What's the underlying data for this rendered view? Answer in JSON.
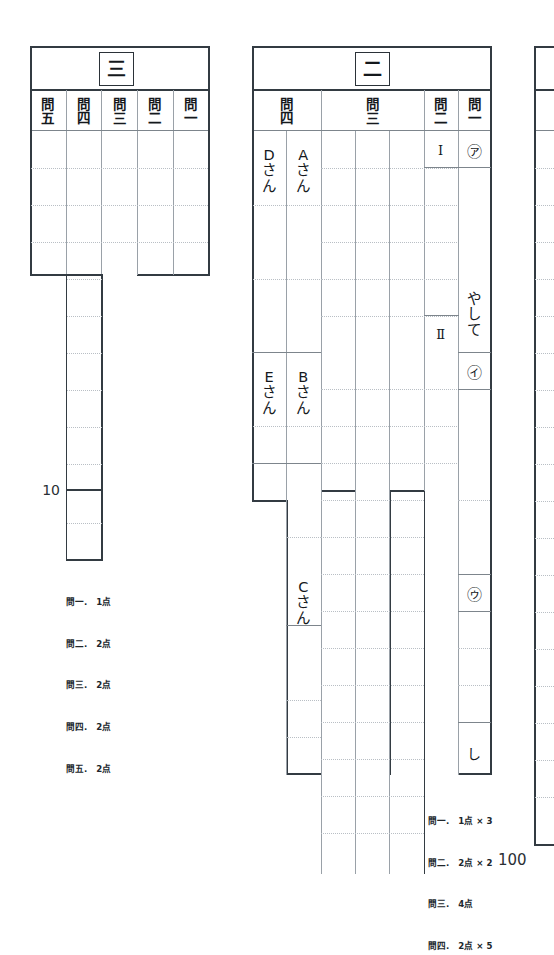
{
  "document": {
    "kind": "japanese-answer-sheet",
    "total_score": "100"
  },
  "sections": [
    {
      "id": "section-three",
      "title": "三",
      "columns": [
        {
          "id": "toi-5",
          "label_top": "問",
          "label_bottom": "五"
        },
        {
          "id": "toi-4",
          "label_top": "問",
          "label_bottom": "四"
        },
        {
          "id": "toi-3",
          "label_top": "問",
          "label_bottom": "三"
        },
        {
          "id": "toi-2",
          "label_top": "問",
          "label_bottom": "二"
        },
        {
          "id": "toi-1",
          "label_top": "問",
          "label_bottom": "一"
        }
      ],
      "side_number": "10",
      "legend": [
        "問一.　1点",
        "問二.　2点",
        "問三.　2点",
        "問四.　2点",
        "問五.　2点"
      ]
    },
    {
      "id": "section-two",
      "title": "二",
      "columns": [
        {
          "id": "toi-4",
          "label_top": "問",
          "label_bottom": "四",
          "span": 2
        },
        {
          "id": "toi-3",
          "label_top": "問",
          "label_bottom": "三",
          "span": 3
        },
        {
          "id": "toi-2",
          "label_top": "問",
          "label_bottom": "二",
          "span": 1
        },
        {
          "id": "toi-1",
          "label_top": "問",
          "label_bottom": "一",
          "span": 1
        }
      ],
      "answers": {
        "toi4_col_left": [
          {
            "id": "d-san",
            "chars": [
              "D",
              "さ",
              "ん"
            ]
          },
          {
            "id": "e-san",
            "chars": [
              "E",
              "さ",
              "ん"
            ]
          }
        ],
        "toi4_col_right": [
          {
            "id": "a-san",
            "chars": [
              "A",
              "さ",
              "ん"
            ]
          },
          {
            "id": "b-san",
            "chars": [
              "B",
              "さ",
              "ん"
            ]
          },
          {
            "id": "c-san",
            "chars": [
              "C",
              "さ",
              "ん"
            ]
          }
        ],
        "toi2": [
          {
            "id": "roman-1",
            "text": "Ⅰ"
          },
          {
            "id": "roman-2",
            "text": "Ⅱ"
          }
        ],
        "toi1": [
          {
            "id": "maru-a",
            "text": "㋐"
          },
          {
            "id": "yashite",
            "chars": [
              "や",
              "し",
              "て"
            ]
          },
          {
            "id": "maru-i",
            "text": "㋑"
          },
          {
            "id": "maru-u",
            "text": "㋒"
          },
          {
            "id": "shi",
            "text": "し"
          }
        ]
      },
      "legend": [
        "問一.　1点 × 3",
        "問二.　2点 × 2",
        "問三.　4点",
        "問四.　2点 × 5"
      ]
    },
    {
      "id": "section-one-partial",
      "title": "",
      "note": "clipped at right edge of page"
    }
  ]
}
